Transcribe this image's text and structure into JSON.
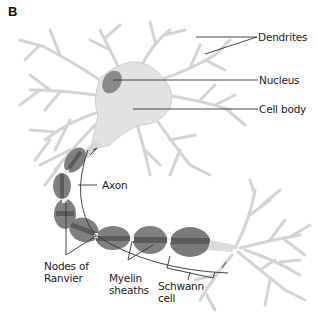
{
  "figure": {
    "panel_letter": "B",
    "colors": {
      "dendrite": "#d6d6d6",
      "cell_body": "#dedede",
      "nucleus": "#8a8a8a",
      "myelin": "#7e7e7e",
      "myelin_band": "#5c5c5c",
      "node": "#eeeeee",
      "leader_line": "#333333",
      "label_text": "#222222"
    }
  },
  "labels": {
    "dendrites": "Dendrites",
    "nucleus": "Nucleus",
    "cell_body": "Cell body",
    "axon": "Axon",
    "nodes_of_ranvier": "Nodes of\nRanvier",
    "myelin_sheaths": "Myelin\nsheaths",
    "schwann_cell": "Schwann\ncell"
  }
}
